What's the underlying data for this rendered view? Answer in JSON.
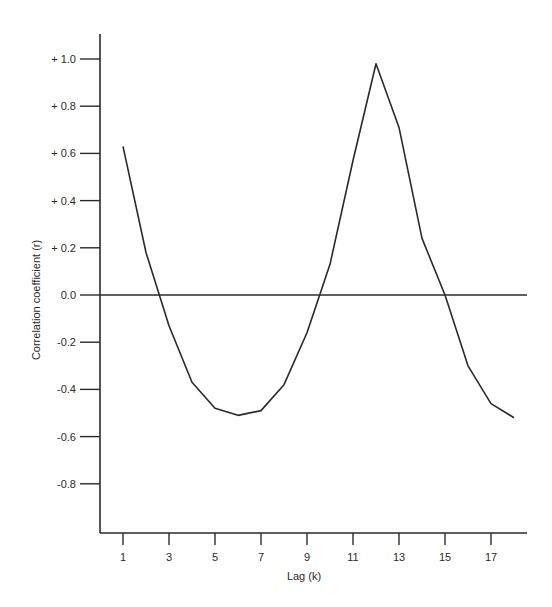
{
  "chart_data": {
    "type": "line",
    "title": "",
    "xlabel": "Lag (k)",
    "ylabel": "Correlation coefficient (r)",
    "x_ticks": [
      1,
      3,
      5,
      7,
      9,
      11,
      13,
      15,
      17
    ],
    "y_ticks": [
      {
        "value": 1.0,
        "label": "+ 1.0"
      },
      {
        "value": 0.8,
        "label": "+ 0.8"
      },
      {
        "value": 0.6,
        "label": "+ 0.6"
      },
      {
        "value": 0.4,
        "label": "+ 0.4"
      },
      {
        "value": 0.2,
        "label": "+ 0.2"
      },
      {
        "value": 0.0,
        "label": "0.0"
      },
      {
        "value": -0.2,
        "label": "-0.2"
      },
      {
        "value": -0.4,
        "label": "-0.4"
      },
      {
        "value": -0.6,
        "label": "-0.6"
      },
      {
        "value": -0.8,
        "label": "-0.8"
      }
    ],
    "xlim": [
      0.1,
      18.6
    ],
    "ylim": [
      -1.01,
      1.11
    ],
    "grid": false,
    "reference_line": {
      "y": 0.0
    },
    "x": [
      1,
      2,
      3,
      4,
      5,
      6,
      7,
      8,
      9,
      10,
      11,
      12,
      13,
      14,
      15,
      16,
      17,
      18
    ],
    "series": [
      {
        "name": "autocorrelation",
        "values": [
          0.63,
          0.18,
          -0.13,
          -0.37,
          -0.48,
          -0.51,
          -0.49,
          -0.38,
          -0.16,
          0.13,
          0.57,
          0.98,
          0.71,
          0.24,
          0.0,
          -0.3,
          -0.46,
          -0.52
        ]
      }
    ],
    "colors": {
      "line": "#2a2a2a",
      "axis": "#2a2a2a"
    }
  }
}
